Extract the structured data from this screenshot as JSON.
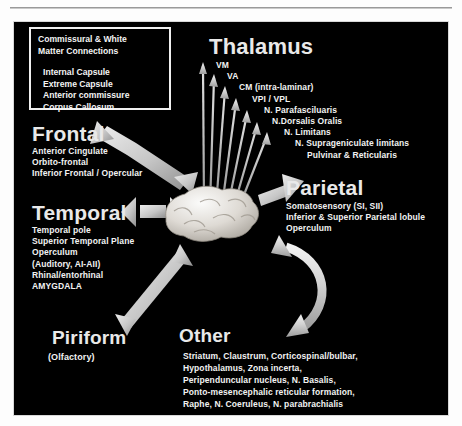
{
  "figure": {
    "legend": {
      "title_lines": [
        "Commissural & White",
        "Matter Connections"
      ],
      "items": [
        "Internal Capsule",
        "Extreme Capsule",
        "Anterior commissure",
        "Corpus Callosum"
      ]
    },
    "center": {
      "label": "brain-illustration"
    },
    "sections": {
      "thalamus": {
        "title": "Thalamus",
        "items": [
          "VM",
          "VA",
          "CM (intra-laminar)",
          "VPI / VPL",
          "N. Parafasciluaris",
          "N.Dorsalis Oralis",
          "N. Limitans",
          "N. Suprageniculate limitans",
          "Pulvinar & Reticularis"
        ]
      },
      "frontal": {
        "title": "Frontal",
        "items": [
          "Anterior Cingulate",
          "Orbito-frontal",
          "Inferior Frontal / Opercular"
        ]
      },
      "parietal": {
        "title": "Parietal",
        "items": [
          "Somatosensory (SI, SII)",
          "Inferior & Superior Parietal lobule",
          "Operculum"
        ]
      },
      "temporal": {
        "title": "Temporal",
        "items": [
          "Temporal pole",
          "Superior Temporal Plane",
          "Operculum",
          "(Auditory, AI-AII)",
          "Rhinal/entorhinal",
          "AMYGDALA"
        ]
      },
      "piriform": {
        "title": "Piriform",
        "items": [
          "(Olfactory)"
        ]
      },
      "other": {
        "title": "Other",
        "items": [
          "Striatum, Claustrum, Corticospinal/bulbar,",
          "Hypothalamus, Zona incerta,",
          "Peripenduncular nucleus, N. Basalis,",
          "Ponto-mesencephalic reticular formation,",
          "Raphe, N. Coeruleus, N. parabrachialis"
        ]
      }
    },
    "colors": {
      "background": "#000000",
      "text": "#f2f2f2",
      "arrow": "#c9c9c9",
      "page": "#ffffff"
    }
  }
}
